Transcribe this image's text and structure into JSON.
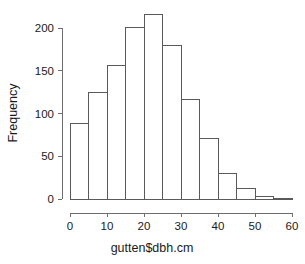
{
  "chart_data": {
    "type": "bar",
    "subtype": "histogram",
    "title": "",
    "subtitle": "",
    "xlabel": "gutten$dbh.cm",
    "ylabel": "Frequency",
    "categories": [
      "0-5",
      "5-10",
      "10-15",
      "15-20",
      "20-25",
      "25-30",
      "30-35",
      "35-40",
      "40-45",
      "45-50",
      "50-55",
      "55-60"
    ],
    "bin_edges": [
      0,
      5,
      10,
      15,
      20,
      25,
      30,
      35,
      40,
      45,
      50,
      55,
      60
    ],
    "bin_width": 5,
    "values": [
      88,
      124,
      156,
      201,
      216,
      179,
      116,
      71,
      30,
      12,
      3,
      1
    ],
    "xlim": [
      0,
      60
    ],
    "ylim": [
      0,
      220
    ],
    "xticks": [
      0,
      10,
      20,
      30,
      40,
      50,
      60
    ],
    "xtick_labels": [
      "0",
      "10",
      "20",
      "30",
      "40",
      "50",
      "60"
    ],
    "yticks": [
      0,
      50,
      100,
      150,
      200
    ],
    "ytick_labels": [
      "0",
      "50",
      "100",
      "150",
      "200"
    ],
    "grid": false,
    "legend": false,
    "legend_position": "none",
    "bar_fill_color": "#ffffff",
    "bar_border_color": "#5a5a5a",
    "axis_color": "#6e6e6e",
    "text_color": "#1a1a1a",
    "background_color": "#ffffff"
  }
}
